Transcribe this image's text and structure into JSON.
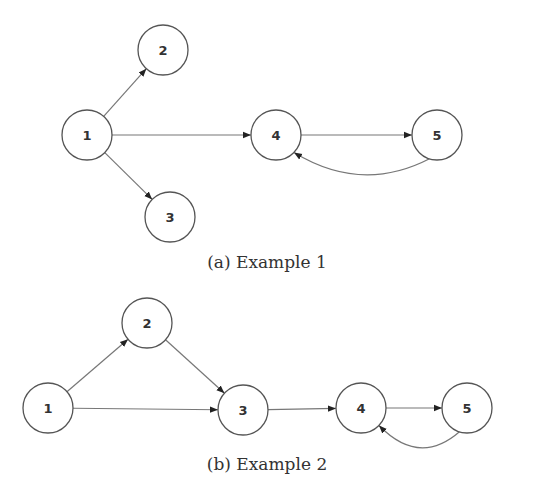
{
  "figures": [
    {
      "caption": "(a) Example 1",
      "nodes": [
        {
          "id": "1",
          "label": "1",
          "x": 87,
          "y": 135
        },
        {
          "id": "2",
          "label": "2",
          "x": 163,
          "y": 50
        },
        {
          "id": "3",
          "label": "3",
          "x": 170,
          "y": 217
        },
        {
          "id": "4",
          "label": "4",
          "x": 276,
          "y": 135
        },
        {
          "id": "5",
          "label": "5",
          "x": 437,
          "y": 135
        }
      ],
      "edges": [
        {
          "from": "1",
          "to": "2"
        },
        {
          "from": "1",
          "to": "3"
        },
        {
          "from": "1",
          "to": "4"
        },
        {
          "from": "4",
          "to": "5"
        },
        {
          "from": "5",
          "to": "4",
          "curved": true
        }
      ]
    },
    {
      "caption": "(b) Example 2",
      "nodes": [
        {
          "id": "1",
          "label": "1",
          "x": 48,
          "y": 408
        },
        {
          "id": "2",
          "label": "2",
          "x": 147,
          "y": 323
        },
        {
          "id": "3",
          "label": "3",
          "x": 243,
          "y": 410
        },
        {
          "id": "4",
          "label": "4",
          "x": 361,
          "y": 408
        },
        {
          "id": "5",
          "label": "5",
          "x": 467,
          "y": 408
        }
      ],
      "edges": [
        {
          "from": "1",
          "to": "2"
        },
        {
          "from": "2",
          "to": "3"
        },
        {
          "from": "1",
          "to": "3"
        },
        {
          "from": "3",
          "to": "4"
        },
        {
          "from": "4",
          "to": "5"
        },
        {
          "from": "5",
          "to": "4",
          "curved": true
        }
      ]
    }
  ]
}
